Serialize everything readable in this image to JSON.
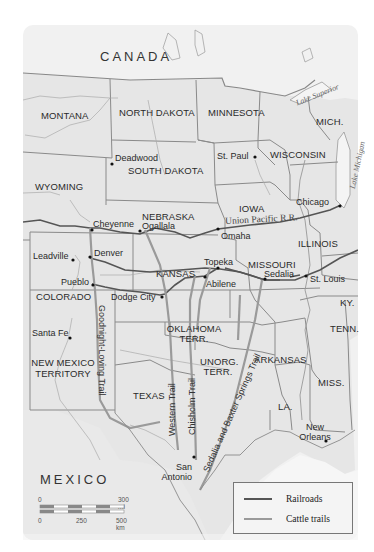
{
  "map": {
    "countries": [
      {
        "name": "CANADA"
      },
      {
        "name": "MEXICO"
      }
    ],
    "states": [
      {
        "name": "MONTANA"
      },
      {
        "name": "NORTH DAKOTA"
      },
      {
        "name": "MINNESOTA"
      },
      {
        "name": "MICH."
      },
      {
        "name": "WISCONSIN"
      },
      {
        "name": "SOUTH DAKOTA"
      },
      {
        "name": "WYOMING"
      },
      {
        "name": "IOWA"
      },
      {
        "name": "NEBRASKA"
      },
      {
        "name": "ILLINOIS"
      },
      {
        "name": "COLORADO"
      },
      {
        "name": "KANSAS"
      },
      {
        "name": "MISSOURI"
      },
      {
        "name": "KY."
      },
      {
        "name": "TENN."
      },
      {
        "name": "OKLAHOMA TERR."
      },
      {
        "name": "UNORG. TERR."
      },
      {
        "name": "ARKANSAS"
      },
      {
        "name": "NEW MEXICO TERRITORY"
      },
      {
        "name": "TEXAS"
      },
      {
        "name": "MISS."
      },
      {
        "name": "LA."
      }
    ],
    "lakes": [
      {
        "name": "Lake Superior"
      },
      {
        "name": "Lake Michigan"
      }
    ],
    "cities": [
      {
        "name": "Deadwood"
      },
      {
        "name": "St. Paul"
      },
      {
        "name": "Chicago"
      },
      {
        "name": "Cheyenne"
      },
      {
        "name": "Ogallala"
      },
      {
        "name": "Omaha"
      },
      {
        "name": "Leadville"
      },
      {
        "name": "Denver"
      },
      {
        "name": "Topeka"
      },
      {
        "name": "Sedalia"
      },
      {
        "name": "St. Louis"
      },
      {
        "name": "Pueblo"
      },
      {
        "name": "Abilene"
      },
      {
        "name": "Dodge City"
      },
      {
        "name": "Santa Fe"
      },
      {
        "name": "San Antonio"
      },
      {
        "name": "New Orleans"
      }
    ],
    "railroads": [
      {
        "name": "Union Pacific R.R."
      }
    ],
    "trails": [
      {
        "name": "Goodnight-Loving Trail"
      },
      {
        "name": "Western Trail"
      },
      {
        "name": "Chisholm Trail"
      },
      {
        "name": "Sedalia and Baxter Springs Trail"
      }
    ],
    "scale": {
      "mi_start": "0",
      "mi_end": "300 mi",
      "km_start": "0",
      "km_mid": "250",
      "km_end": "500 km"
    },
    "legend": [
      {
        "label": "Railroads",
        "color": "#555555"
      },
      {
        "label": "Cattle trails",
        "color": "#9a9a9a"
      }
    ],
    "colors": {
      "land": "#e8e8e8",
      "water": "#f7f7f7",
      "border": "#8a8a8a",
      "railroad": "#555555",
      "trail": "#9a9a9a"
    }
  }
}
